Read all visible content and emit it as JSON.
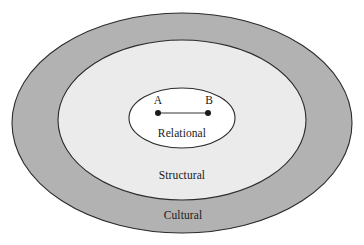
{
  "diagram": {
    "type": "concentric-ellipses",
    "title_visible": false,
    "colors": {
      "outer_ring_fill": "#b2b2b2",
      "middle_ring_fill": "#ebebeb",
      "inner_fill": "#ffffff",
      "stroke": "#2b2b2b",
      "node_fill": "#1a1a1a",
      "edge_stroke": "#777777",
      "background": "#ffffff"
    },
    "layers": [
      {
        "id": "cultural",
        "label": "Cultural",
        "label_x": 183,
        "label_y": 219,
        "ellipse": {
          "cx": 182,
          "cy": 123,
          "rx": 170,
          "ry": 110
        },
        "fill": "#b2b2b2"
      },
      {
        "id": "structural",
        "label": "Structural",
        "label_x": 182,
        "label_y": 179,
        "ellipse": {
          "cx": 182,
          "cy": 120,
          "rx": 124,
          "ry": 80
        },
        "fill": "#ebebeb"
      },
      {
        "id": "relational",
        "label": "Relational",
        "label_x": 182,
        "label_y": 137,
        "ellipse": {
          "cx": 182,
          "cy": 118,
          "rx": 53,
          "ry": 30
        },
        "fill": "#ffffff"
      }
    ],
    "nodes": [
      {
        "id": "a",
        "label": "A",
        "x": 158,
        "y": 113,
        "label_x": 158,
        "label_y": 104,
        "r": 3
      },
      {
        "id": "b",
        "label": "B",
        "x": 208,
        "y": 113,
        "label_x": 209,
        "label_y": 104,
        "r": 3
      }
    ],
    "edges": [
      {
        "id": "edge-a-b",
        "from": "a",
        "to": "b",
        "x1": 158,
        "y1": 113,
        "x2": 208,
        "y2": 113
      }
    ]
  }
}
